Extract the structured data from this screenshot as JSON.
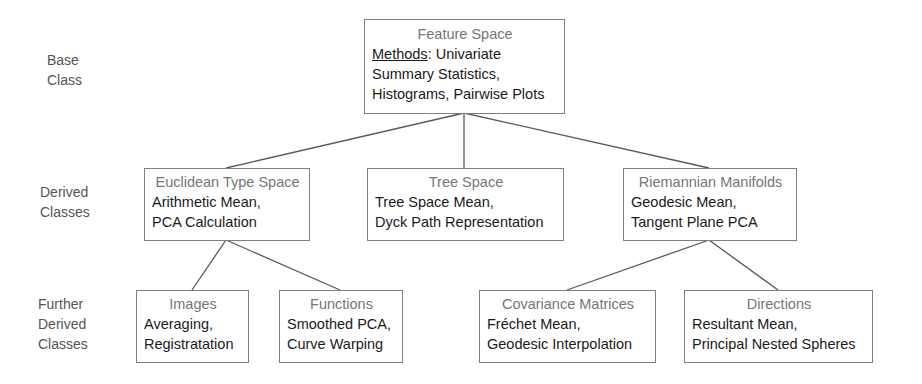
{
  "diagram": {
    "levels": [
      {
        "id": "base",
        "lines": [
          "Base",
          "Class"
        ]
      },
      {
        "id": "derived",
        "lines": [
          "Derived",
          "Classes"
        ]
      },
      {
        "id": "further",
        "lines": [
          "Further",
          "Derived",
          "Classes"
        ]
      }
    ],
    "nodes": {
      "feature_space": {
        "title": "Feature Space",
        "methods_label": "Methods",
        "methods_sep": ": Univariate",
        "lines": [
          "Summary Statistics,",
          "Histograms, Pairwise Plots"
        ]
      },
      "euclidean": {
        "title": "Euclidean Type Space",
        "lines": [
          "Arithmetic Mean,",
          "PCA Calculation"
        ]
      },
      "tree": {
        "title": "Tree Space",
        "lines": [
          "Tree Space Mean,",
          "Dyck Path Representation"
        ]
      },
      "riemannian": {
        "title": "Riemannian Manifolds",
        "lines": [
          "Geodesic Mean,",
          "Tangent Plane PCA"
        ]
      },
      "images": {
        "title": "Images",
        "lines": [
          "Averaging,",
          "Registratation"
        ]
      },
      "functions": {
        "title": "Functions",
        "lines": [
          "Smoothed PCA,",
          "Curve Warping"
        ]
      },
      "covariance": {
        "title": "Covariance Matrices",
        "lines": [
          "Fréchet Mean,",
          "Geodesic Interpolation"
        ]
      },
      "directions": {
        "title": "Directions",
        "lines": [
          "Resultant Mean,",
          "Principal Nested Spheres"
        ]
      }
    },
    "edges": [
      {
        "from": "feature_space",
        "to": "euclidean"
      },
      {
        "from": "feature_space",
        "to": "tree"
      },
      {
        "from": "feature_space",
        "to": "riemannian"
      },
      {
        "from": "euclidean",
        "to": "images"
      },
      {
        "from": "euclidean",
        "to": "functions"
      },
      {
        "from": "riemannian",
        "to": "covariance"
      },
      {
        "from": "riemannian",
        "to": "directions"
      }
    ],
    "colors": {
      "border": "#7f7f7f",
      "title_text": "#767676",
      "body_text": "#1a1a1a",
      "connector": "#595959",
      "level_label": "#555555"
    }
  }
}
